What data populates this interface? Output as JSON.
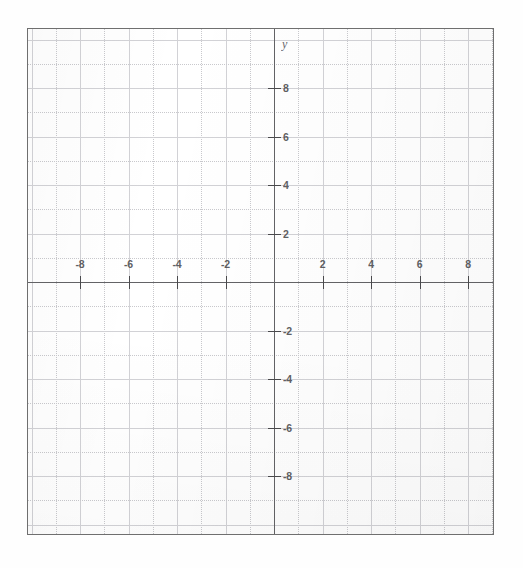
{
  "figure": {
    "kind": "blank-cartesian-coordinate-grid",
    "axis_labels": {
      "x": "x",
      "y": "y"
    }
  },
  "chart_data": {
    "type": "scatter",
    "title": "",
    "xlabel": "x",
    "ylabel": "y",
    "series": [],
    "x": [],
    "values": [],
    "xlim": [
      -10.1,
      9.1
    ],
    "ylim": [
      -10.5,
      10.4
    ],
    "grid": true,
    "grid_minor_step": 1,
    "grid_major_step": 2,
    "legend": "none",
    "x_tick_labels": [
      "-8",
      "-6",
      "-4",
      "-2",
      "2",
      "4",
      "6",
      "8"
    ],
    "x_tick_values": [
      -8,
      -6,
      -4,
      -2,
      2,
      4,
      6,
      8
    ],
    "y_tick_labels": [
      "8",
      "6",
      "4",
      "2",
      "-2",
      "-4",
      "-6",
      "-8"
    ],
    "y_tick_values": [
      8,
      6,
      4,
      2,
      -2,
      -4,
      -6,
      -8
    ],
    "annotations": []
  },
  "ticks": {
    "x": [
      {
        "label": "-8",
        "value": -8
      },
      {
        "label": "-6",
        "value": -6
      },
      {
        "label": "-4",
        "value": -4
      },
      {
        "label": "-2",
        "value": -2
      },
      {
        "label": "2",
        "value": 2
      },
      {
        "label": "4",
        "value": 4
      },
      {
        "label": "6",
        "value": 6
      },
      {
        "label": "8",
        "value": 8
      }
    ],
    "y": [
      {
        "label": "8",
        "value": 8
      },
      {
        "label": "6",
        "value": 6
      },
      {
        "label": "4",
        "value": 4
      },
      {
        "label": "2",
        "value": 2
      },
      {
        "label": "-2",
        "value": -2
      },
      {
        "label": "-4",
        "value": -4
      },
      {
        "label": "-6",
        "value": -6
      },
      {
        "label": "-8",
        "value": -8
      }
    ]
  },
  "colors": {
    "axis": "#636366",
    "tick": "#4a4a4d",
    "grid_major": "#d2d2d6",
    "grid_minor": "#c9c9cd",
    "frame": "#6f6f6f",
    "label_text": "#4b4b4e",
    "paper": "#ffffff"
  },
  "geometry": {
    "origin_x_px": 246,
    "origin_y_px": 253,
    "unit_px": 24.25,
    "frame_left_px": 27,
    "frame_top_px": 28,
    "frame_width_px": 467,
    "frame_height_px": 507
  }
}
